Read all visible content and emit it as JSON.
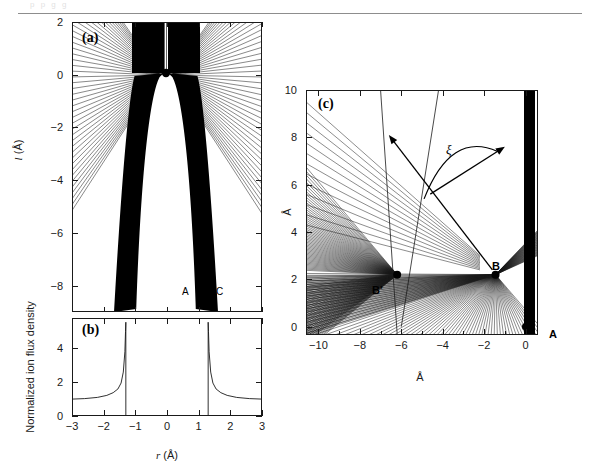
{
  "figure": {
    "domain": "scientific-figure",
    "background": "#ffffff",
    "ink": "#1a1a1a",
    "top_rule_color": "#8d8d8d",
    "ghost_header": "p p g g"
  },
  "panels": [
    {
      "id": "a",
      "tag": "(a)",
      "xlabel": "",
      "ylabel": "l (Å)",
      "ylabel_italic_part": "l",
      "ylabel_unit": "(Å)",
      "x_range": [
        -3,
        3
      ],
      "y_range": [
        -9,
        2
      ],
      "y_ticks": [
        2,
        0,
        -2,
        -4,
        -6,
        -8
      ],
      "y_tick_labels": [
        "2",
        "0",
        "-2",
        "-4",
        "-6",
        "-8"
      ],
      "x_ticks": [
        -3,
        -2,
        -1,
        0,
        1,
        2,
        3
      ],
      "markers": [
        {
          "name": "apex-dot",
          "x": 0.05,
          "y": 0.15,
          "r": 4
        }
      ],
      "region_labels": [
        {
          "text": "A",
          "x": -0.45,
          "y": -7.6
        },
        {
          "text": "B",
          "x": 0.05,
          "y": -7.6
        },
        {
          "text": "C",
          "x": 0.55,
          "y": -7.6
        }
      ],
      "caption_note": "ion trajectories converging on a dark caustic sheath band"
    },
    {
      "id": "b",
      "tag": "(b)",
      "xlabel": "r (Å)",
      "xlabel_italic_part": "r",
      "xlabel_unit": "(Å)",
      "ylabel": "Normalized ion flux density",
      "x_range": [
        -3,
        3
      ],
      "y_range": [
        0,
        5.8
      ],
      "x_ticks": [
        -3,
        -2,
        -1,
        0,
        1,
        2,
        3
      ],
      "x_tick_labels": [
        "-3",
        "-2",
        "-1",
        "0",
        "1",
        "2",
        "3"
      ],
      "y_ticks": [
        0,
        2,
        4
      ],
      "y_tick_labels": [
        "0",
        "2",
        "4"
      ],
      "singularities": [
        -1.3,
        1.3
      ],
      "baseline_value": 1.0,
      "peak_value": 5.5
    },
    {
      "id": "c",
      "tag": "(c)",
      "xlabel": "Å",
      "ylabel": "Å",
      "x_range": [
        -10.6,
        0.6
      ],
      "y_range": [
        -0.35,
        10
      ],
      "x_ticks": [
        -10,
        -8,
        -6,
        -4,
        -2,
        0
      ],
      "x_tick_labels": [
        "-10",
        "-8",
        "-6",
        "-4",
        "-2",
        "0"
      ],
      "x_minor_ticks": [
        -9,
        -7,
        -5,
        -3,
        -1
      ],
      "y_ticks": [
        0,
        2,
        4,
        6,
        8,
        10
      ],
      "y_tick_labels": [
        "0",
        "2",
        "4",
        "6",
        "8",
        "10"
      ],
      "markers": [
        {
          "name": "point-B-prime",
          "label": "B'",
          "x": -6.2,
          "y": 2.2
        },
        {
          "name": "point-B",
          "label": "B",
          "x": -1.45,
          "y": 2.2
        },
        {
          "name": "point-A",
          "label": "A",
          "x": 0.0,
          "y": 0.0
        }
      ],
      "angle_annotation": {
        "symbol": "ξ",
        "name": "xi-angle",
        "description": "double-headed arc between two rays emanating from point B"
      }
    }
  ],
  "chart_data": [
    {
      "type": "line",
      "panel": "a",
      "title": "(a)",
      "xlabel": "",
      "ylabel": "l (Å)",
      "xlim": [
        -3,
        3
      ],
      "ylim": [
        -9,
        2
      ],
      "xticks": [
        -3,
        -2,
        -1,
        0,
        1,
        2,
        3
      ],
      "yticks": [
        2,
        0,
        -2,
        -4,
        -6,
        -8
      ],
      "grid": false,
      "annotations": [
        "A",
        "B",
        "C"
      ],
      "description": "Fan of straight ion trajectories focusing onto two dark caustic bands flanking a parabolic field-free cavity; a filled dot marks the emitter apex near (0, 0.15)."
    },
    {
      "type": "line",
      "panel": "b",
      "title": "(b)",
      "xlabel": "r (Å)",
      "ylabel": "Normalized ion flux density",
      "xlim": [
        -3,
        3
      ],
      "ylim": [
        0,
        5.8
      ],
      "xticks": [
        -3,
        -2,
        -1,
        0,
        1,
        2,
        3
      ],
      "yticks": [
        0,
        2,
        4
      ],
      "grid": false,
      "x": [
        -3.0,
        -2.6,
        -2.2,
        -1.9,
        -1.7,
        -1.55,
        -1.45,
        -1.38,
        -1.33,
        -1.31,
        -1.3,
        1.3,
        1.31,
        1.33,
        1.38,
        1.45,
        1.55,
        1.7,
        1.9,
        2.2,
        2.6,
        3.0
      ],
      "values": [
        1.0,
        1.03,
        1.1,
        1.22,
        1.38,
        1.6,
        1.95,
        2.6,
        3.8,
        5.0,
        5.55,
        5.55,
        5.0,
        3.8,
        2.6,
        1.95,
        1.6,
        1.38,
        1.22,
        1.1,
        1.03,
        1.0
      ],
      "description": "Normalized ion flux density versus radius, flat at 1.0 far from axis and diverging to ~5.5 at the caustic radii r = ±1.3 Å; zero between the two singular edges."
    },
    {
      "type": "scatter",
      "panel": "c",
      "title": "(c)",
      "xlabel": "Å",
      "ylabel": "Å",
      "xlim": [
        -10.6,
        0.6
      ],
      "ylim": [
        -0.35,
        10
      ],
      "xticks": [
        -10,
        -8,
        -6,
        -4,
        -2,
        0
      ],
      "yticks": [
        0,
        2,
        4,
        6,
        8,
        10
      ],
      "grid": false,
      "points": [
        {
          "label": "B'",
          "x": -6.2,
          "y": 2.2
        },
        {
          "label": "B",
          "x": -1.45,
          "y": 2.2
        },
        {
          "label": "A",
          "x": 0.0,
          "y": 0.0
        }
      ],
      "annotations": [
        "ξ"
      ],
      "description": "Detail of ion trajectory envelope near the emitter apex: straight-line trajectories form cusped caustics meeting at focal points B and B'; the angle ξ is measured between two outgoing rays from B."
    }
  ]
}
